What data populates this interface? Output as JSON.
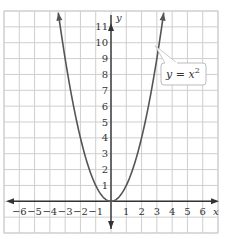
{
  "chart_data": {
    "type": "line",
    "title": "",
    "xlabel": "x",
    "ylabel": "y",
    "xlim": [
      -7,
      7
    ],
    "ylim": [
      -2,
      12
    ],
    "grid": true,
    "x_ticks": [
      "−6",
      "−5",
      "−4",
      "−3",
      "−2",
      "−1",
      "1",
      "2",
      "3",
      "4",
      "5",
      "6"
    ],
    "y_ticks": [
      "1",
      "2",
      "3",
      "4",
      "5",
      "6",
      "7",
      "8",
      "9",
      "10",
      "11"
    ],
    "series": [
      {
        "name": "y = x²",
        "function": "y = x^2",
        "x": [
          -3.4,
          -3,
          -2.5,
          -2,
          -1.5,
          -1,
          -0.5,
          0,
          0.5,
          1,
          1.5,
          2,
          2.5,
          3,
          3.4
        ],
        "values": [
          11.56,
          9,
          6.25,
          4,
          2.25,
          1,
          0.25,
          0,
          0.25,
          1,
          2.25,
          4,
          6.25,
          9,
          11.56
        ]
      }
    ],
    "annotations": [
      {
        "text_base": "y = x",
        "superscript": "2",
        "points_to": [
          2.9,
          9.8
        ]
      }
    ],
    "colors": {
      "curve": "#555555",
      "grid": "#cfcfcf",
      "axes": "#333333",
      "label_border": "#a9d08e"
    }
  }
}
